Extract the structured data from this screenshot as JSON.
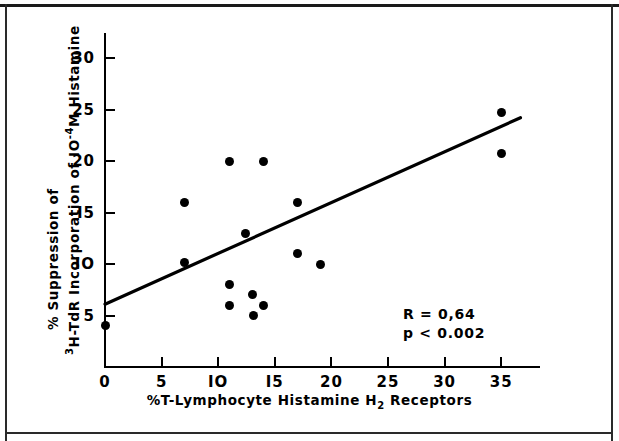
{
  "chart_data": {
    "type": "scatter",
    "title": "",
    "xlabel": "%T-Lymphocyte   Histamine  H2  Receptors",
    "xlabel_parts": {
      "pre": "%T-Lymphocyte   Histamine  H",
      "sub": "2",
      "post": "  Receptors"
    },
    "ylabel_line1": "% Suppression of",
    "ylabel_line2_pre": "H-TdR Incorporation of IO",
    "ylabel_line2_sup_lead": "3",
    "ylabel_line2_exp": "-4",
    "ylabel_line2_post": "M  Histamine",
    "xlim": [
      0,
      38.5
    ],
    "ylim": [
      0,
      30
    ],
    "xticks": [
      0,
      5,
      10,
      15,
      20,
      25,
      30,
      35
    ],
    "xtick_labels": [
      "0",
      "5",
      "IO",
      "I5",
      "20",
      "25",
      "30",
      "35"
    ],
    "yticks": [
      5,
      10,
      15,
      20,
      25,
      30
    ],
    "ytick_labels": [
      "5",
      "IO",
      "I5",
      "20",
      "25",
      "30"
    ],
    "grid": false,
    "legend": "none",
    "marker_color": "#000000",
    "line_color": "#000000",
    "points": [
      {
        "x": 0.0,
        "y": 4.0
      },
      {
        "x": 7.0,
        "y": 16.0
      },
      {
        "x": 7.0,
        "y": 10.1
      },
      {
        "x": 11.0,
        "y": 20.0
      },
      {
        "x": 11.0,
        "y": 8.0
      },
      {
        "x": 11.0,
        "y": 6.0
      },
      {
        "x": 12.4,
        "y": 13.0
      },
      {
        "x": 13.0,
        "y": 7.0
      },
      {
        "x": 13.1,
        "y": 5.0
      },
      {
        "x": 14.0,
        "y": 20.0
      },
      {
        "x": 14.0,
        "y": 6.0
      },
      {
        "x": 17.0,
        "y": 16.0
      },
      {
        "x": 17.0,
        "y": 11.0
      },
      {
        "x": 19.0,
        "y": 10.0
      },
      {
        "x": 35.0,
        "y": 24.7
      },
      {
        "x": 35.0,
        "y": 20.7
      }
    ],
    "regression_line": {
      "x0": 0.0,
      "y0": 6.1,
      "x1": 36.7,
      "y1": 24.2
    },
    "annotations": {
      "r_label": "R = 0,64",
      "p_label": "p < 0.002"
    }
  }
}
